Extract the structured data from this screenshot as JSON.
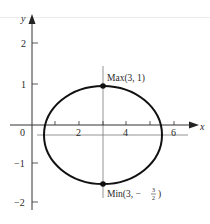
{
  "figure": {
    "type": "ellipse-extrema-plot",
    "axes": {
      "x_label": "x",
      "y_label": "y",
      "x_ticks": [
        {
          "value": 1,
          "label": ""
        },
        {
          "value": 2,
          "label": "2"
        },
        {
          "value": 3,
          "label": ""
        },
        {
          "value": 4,
          "label": "4"
        },
        {
          "value": 5,
          "label": ""
        },
        {
          "value": 6,
          "label": "6"
        }
      ],
      "y_ticks": [
        {
          "value": 2,
          "label": "2"
        },
        {
          "value": 1,
          "label": "1"
        },
        {
          "value": -1,
          "label": "−1"
        },
        {
          "value": -2,
          "label": "−2"
        }
      ],
      "origin_label": "0"
    },
    "curve": {
      "shape": "ellipse",
      "center": [
        3,
        -0.25
      ],
      "semi_axis_x": 2.5,
      "semi_axis_y": 1.25,
      "color": "#111111"
    },
    "points": {
      "max": {
        "x": 3,
        "y": 1,
        "label_prefix": "Max(3, 1)"
      },
      "min": {
        "x": 3,
        "y": -1.5,
        "label_prefix": "Min(3, −",
        "frac_num": "3",
        "frac_den": "2",
        "label_suffix": ")"
      }
    },
    "reference_lines": {
      "vertical_x": 3,
      "horizontal_y": -0.25
    }
  }
}
